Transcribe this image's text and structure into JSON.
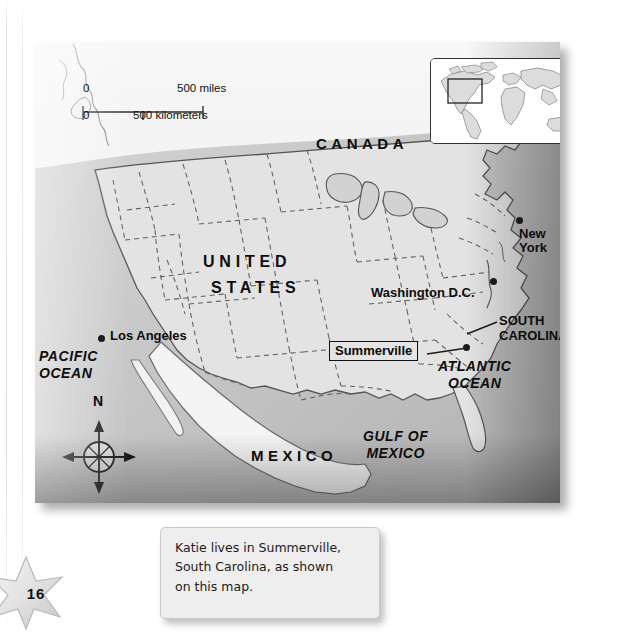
{
  "page": {
    "number": "16"
  },
  "map": {
    "scale": {
      "miles_start": "0",
      "miles_end": "500 miles",
      "km_start": "0",
      "km_end": "500 kilometers"
    },
    "countries": [
      {
        "name": "CANADA"
      },
      {
        "name": "UNITED",
        "name2": "STATES"
      },
      {
        "name": "MEXICO"
      }
    ],
    "oceans": [
      {
        "line1": "PACIFIC",
        "line2": "OCEAN"
      },
      {
        "line1": "ATLANTIC",
        "line2": "OCEAN"
      },
      {
        "line1": "GULF OF",
        "line2": "MEXICO"
      }
    ],
    "cities": [
      {
        "name": "Los Angeles"
      },
      {
        "name": "Washington D.C."
      },
      {
        "name": "New",
        "name2": "York"
      }
    ],
    "states": [
      {
        "line1": "SOUTH",
        "line2": "CAROLINA"
      }
    ],
    "callout": {
      "label": "Summerville"
    },
    "compass": {
      "north": "N"
    },
    "colors": {
      "land": "#e3e3e3",
      "ocean": "#c9c9c9",
      "border": "#4a4a4a",
      "state_border": "#5a5a5a",
      "label": "#0d0d0d"
    }
  },
  "caption": {
    "line1": "Katie lives in Summerville,",
    "line2": "South Carolina, as shown",
    "line3": "on this map."
  }
}
